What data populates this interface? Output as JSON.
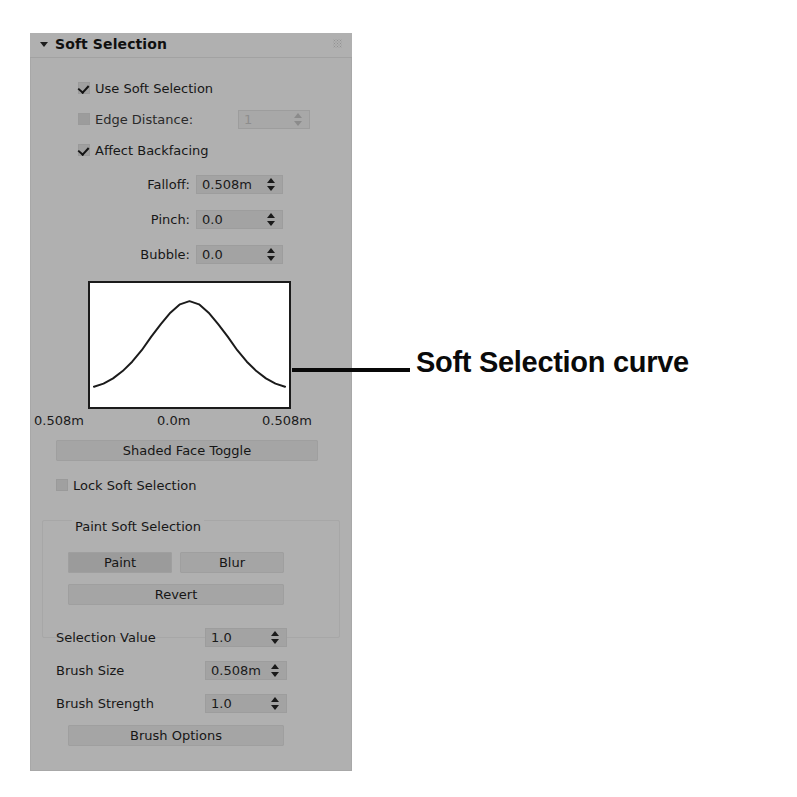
{
  "panel": {
    "rollout_title": "Soft Selection",
    "collapse_arrow_icon": "triangle-down-icon",
    "grip_icon": "drag-grip-icon",
    "checkboxes": [
      {
        "label": "Use Soft Selection",
        "checked": true,
        "enabled": true
      },
      {
        "label": "Edge Distance:",
        "checked": false,
        "enabled": false
      },
      {
        "label": "Affect Backfacing",
        "checked": true,
        "enabled": true
      },
      {
        "label": "Lock Soft Selection",
        "checked": false,
        "enabled": true
      }
    ],
    "edge_distance": {
      "value": "1",
      "enabled": false
    },
    "fields": [
      {
        "label": "Falloff:",
        "value": "0.508m"
      },
      {
        "label": "Pinch:",
        "value": "0.0"
      },
      {
        "label": "Bubble:",
        "value": "0.0"
      }
    ],
    "graph": {
      "axis_left": "0.508m",
      "axis_center": "0.0m",
      "axis_right": "0.508m"
    },
    "shaded_face_toggle": "Shaded Face Toggle",
    "paint_group": {
      "title": "Paint Soft Selection",
      "paint_button": "Paint",
      "blur_button": "Blur",
      "revert_button": "Revert",
      "fields": [
        {
          "label": "Selection Value",
          "value": "1.0"
        },
        {
          "label": "Brush Size",
          "value": "0.508m"
        },
        {
          "label": "Brush Strength",
          "value": "1.0"
        }
      ],
      "brush_options_button": "Brush Options"
    }
  },
  "annotation": {
    "label": "Soft Selection curve",
    "leader_icon": "leader-line"
  },
  "chart_data": {
    "type": "line",
    "xlabel": "",
    "ylabel": "",
    "xticklabels": [
      "0.508m",
      "0.0m",
      "0.508m"
    ],
    "x": [
      -1.0,
      -0.9,
      -0.8,
      -0.7,
      -0.6,
      -0.5,
      -0.4,
      -0.3,
      -0.2,
      -0.1,
      0.0,
      0.1,
      0.2,
      0.3,
      0.4,
      0.5,
      0.6,
      0.7,
      0.8,
      0.9,
      1.0
    ],
    "y": [
      0.1,
      0.13,
      0.18,
      0.25,
      0.34,
      0.45,
      0.58,
      0.7,
      0.81,
      0.89,
      0.92,
      0.89,
      0.81,
      0.7,
      0.58,
      0.45,
      0.34,
      0.25,
      0.18,
      0.13,
      0.1
    ],
    "xlim": [
      -1.0,
      1.0
    ],
    "ylim": [
      0.0,
      1.0
    ],
    "grid": false,
    "legend": false,
    "line_color": "#1b1b1b"
  },
  "colors": {
    "panel_bg": "#b0b0b0",
    "field_bg": "#a3a3a3",
    "button_bg": "#a5a5a5",
    "text": "#171717",
    "graph_bg": "#ffffff",
    "curve": "#1b1b1b",
    "page_bg": "#ffffff"
  }
}
